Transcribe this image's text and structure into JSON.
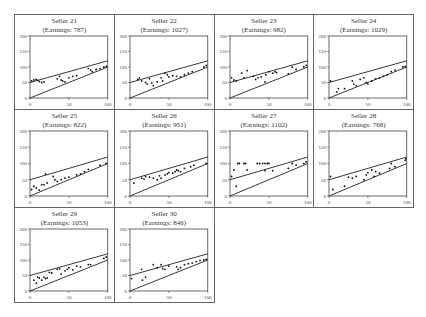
{
  "chart_data": {
    "type": "scatter",
    "title": "",
    "xlim": [
      0,
      100
    ],
    "ylim": [
      0,
      200
    ],
    "xticks": [
      0,
      50,
      100
    ],
    "yticks": [
      0,
      50,
      100,
      150,
      200
    ],
    "reference_lines": [
      {
        "name": "upper",
        "x": [
          0,
          100
        ],
        "y": [
          50,
          120
        ]
      },
      {
        "name": "lower",
        "x": [
          0,
          100
        ],
        "y": [
          0,
          100
        ]
      }
    ],
    "panels": [
      {
        "seller": "Seller 21",
        "earnings_label": "(Earnings: 787)",
        "earnings": 787,
        "points": [
          [
            2,
            55
          ],
          [
            5,
            58
          ],
          [
            8,
            60
          ],
          [
            10,
            57
          ],
          [
            12,
            53
          ],
          [
            15,
            50
          ],
          [
            18,
            52
          ],
          [
            35,
            62
          ],
          [
            38,
            70
          ],
          [
            40,
            58
          ],
          [
            42,
            55
          ],
          [
            45,
            52
          ],
          [
            50,
            65
          ],
          [
            55,
            70
          ],
          [
            60,
            72
          ],
          [
            75,
            95
          ],
          [
            78,
            90
          ],
          [
            80,
            85
          ],
          [
            85,
            92
          ],
          [
            90,
            95
          ],
          [
            95,
            100
          ],
          [
            98,
            102
          ]
        ]
      },
      {
        "seller": "Seller 22",
        "earnings_label": "(Earnings: 1027)",
        "earnings": 1027,
        "points": [
          [
            10,
            60
          ],
          [
            12,
            65
          ],
          [
            15,
            55
          ],
          [
            20,
            50
          ],
          [
            22,
            45
          ],
          [
            25,
            62
          ],
          [
            28,
            48
          ],
          [
            30,
            40
          ],
          [
            35,
            52
          ],
          [
            40,
            65
          ],
          [
            42,
            55
          ],
          [
            45,
            80
          ],
          [
            48,
            75
          ],
          [
            50,
            68
          ],
          [
            55,
            72
          ],
          [
            60,
            70
          ],
          [
            65,
            68
          ],
          [
            70,
            75
          ],
          [
            75,
            80
          ],
          [
            80,
            85
          ],
          [
            95,
            100
          ],
          [
            98,
            105
          ]
        ]
      },
      {
        "seller": "Seller 23",
        "earnings_label": "(Earnings: 982)",
        "earnings": 982,
        "points": [
          [
            2,
            65
          ],
          [
            5,
            58
          ],
          [
            8,
            55
          ],
          [
            15,
            80
          ],
          [
            18,
            65
          ],
          [
            22,
            88
          ],
          [
            30,
            70
          ],
          [
            33,
            60
          ],
          [
            36,
            65
          ],
          [
            40,
            68
          ],
          [
            45,
            52
          ],
          [
            46,
            75
          ],
          [
            50,
            85
          ],
          [
            55,
            80
          ],
          [
            58,
            85
          ],
          [
            60,
            82
          ],
          [
            75,
            78
          ],
          [
            80,
            100
          ],
          [
            85,
            92
          ],
          [
            95,
            100
          ],
          [
            98,
            105
          ]
        ]
      },
      {
        "seller": "Seller 24",
        "earnings_label": "(Earnings: 1029)",
        "earnings": 1029,
        "points": [
          [
            2,
            55
          ],
          [
            10,
            20
          ],
          [
            12,
            30
          ],
          [
            20,
            30
          ],
          [
            30,
            55
          ],
          [
            32,
            45
          ],
          [
            35,
            40
          ],
          [
            40,
            60
          ],
          [
            45,
            65
          ],
          [
            48,
            50
          ],
          [
            50,
            45
          ],
          [
            55,
            55
          ],
          [
            60,
            62
          ],
          [
            65,
            65
          ],
          [
            70,
            70
          ],
          [
            75,
            75
          ],
          [
            80,
            85
          ],
          [
            85,
            90
          ],
          [
            95,
            100
          ],
          [
            98,
            102
          ]
        ]
      },
      {
        "seller": "Seller 25",
        "earnings_label": "(Earnings: 822)",
        "earnings": 822,
        "points": [
          [
            2,
            20
          ],
          [
            5,
            30
          ],
          [
            8,
            25
          ],
          [
            12,
            18
          ],
          [
            15,
            35
          ],
          [
            18,
            35
          ],
          [
            20,
            68
          ],
          [
            22,
            40
          ],
          [
            30,
            60
          ],
          [
            32,
            50
          ],
          [
            35,
            45
          ],
          [
            40,
            50
          ],
          [
            45,
            55
          ],
          [
            50,
            58
          ],
          [
            60,
            65
          ],
          [
            65,
            68
          ],
          [
            70,
            75
          ],
          [
            75,
            82
          ],
          [
            90,
            95
          ],
          [
            98,
            100
          ]
        ]
      },
      {
        "seller": "Seller 26",
        "earnings_label": "(Earnings: 951)",
        "earnings": 951,
        "points": [
          [
            5,
            40
          ],
          [
            15,
            55
          ],
          [
            18,
            52
          ],
          [
            20,
            60
          ],
          [
            25,
            58
          ],
          [
            30,
            55
          ],
          [
            35,
            50
          ],
          [
            38,
            62
          ],
          [
            40,
            55
          ],
          [
            45,
            65
          ],
          [
            48,
            68
          ],
          [
            50,
            72
          ],
          [
            55,
            70
          ],
          [
            58,
            75
          ],
          [
            60,
            80
          ],
          [
            62,
            78
          ],
          [
            65,
            75
          ],
          [
            70,
            85
          ],
          [
            78,
            90
          ],
          [
            82,
            95
          ],
          [
            98,
            100
          ]
        ]
      },
      {
        "seller": "Seller 27",
        "earnings_label": "(Earnings: 1102)",
        "earnings": 1102,
        "points": [
          [
            2,
            60
          ],
          [
            5,
            80
          ],
          [
            8,
            30
          ],
          [
            10,
            100
          ],
          [
            12,
            100
          ],
          [
            18,
            100
          ],
          [
            20,
            100
          ],
          [
            22,
            80
          ],
          [
            35,
            100
          ],
          [
            38,
            100
          ],
          [
            42,
            100
          ],
          [
            45,
            100
          ],
          [
            48,
            100
          ],
          [
            50,
            100
          ],
          [
            45,
            78
          ],
          [
            55,
            78
          ],
          [
            75,
            85
          ],
          [
            80,
            100
          ],
          [
            85,
            95
          ],
          [
            95,
            100
          ],
          [
            98,
            105
          ]
        ]
      },
      {
        "seller": "Seller 28",
        "earnings_label": "(Earnings: 768)",
        "earnings": 768,
        "points": [
          [
            2,
            60
          ],
          [
            5,
            20
          ],
          [
            20,
            30
          ],
          [
            25,
            58
          ],
          [
            30,
            55
          ],
          [
            35,
            60
          ],
          [
            45,
            50
          ],
          [
            48,
            65
          ],
          [
            50,
            72
          ],
          [
            55,
            80
          ],
          [
            58,
            60
          ],
          [
            60,
            75
          ],
          [
            65,
            70
          ],
          [
            78,
            85
          ],
          [
            80,
            100
          ],
          [
            85,
            90
          ],
          [
            98,
            110
          ],
          [
            99,
            115
          ]
        ]
      },
      {
        "seller": "Seller 29",
        "earnings_label": "(Earnings: 1053)",
        "earnings": 1053,
        "points": [
          [
            5,
            35
          ],
          [
            8,
            25
          ],
          [
            10,
            45
          ],
          [
            12,
            42
          ],
          [
            15,
            35
          ],
          [
            18,
            45
          ],
          [
            20,
            40
          ],
          [
            22,
            42
          ],
          [
            25,
            60
          ],
          [
            28,
            58
          ],
          [
            35,
            70
          ],
          [
            38,
            72
          ],
          [
            40,
            55
          ],
          [
            45,
            65
          ],
          [
            48,
            70
          ],
          [
            50,
            75
          ],
          [
            55,
            68
          ],
          [
            60,
            80
          ],
          [
            65,
            78
          ],
          [
            75,
            85
          ],
          [
            78,
            85
          ],
          [
            95,
            105
          ],
          [
            98,
            110
          ]
        ]
      },
      {
        "seller": "Seller 30",
        "earnings_label": "(Earnings: 846)",
        "earnings": 846,
        "points": [
          [
            2,
            40
          ],
          [
            15,
            70
          ],
          [
            16,
            35
          ],
          [
            20,
            45
          ],
          [
            30,
            85
          ],
          [
            35,
            75
          ],
          [
            40,
            85
          ],
          [
            42,
            72
          ],
          [
            45,
            70
          ],
          [
            50,
            80
          ],
          [
            60,
            78
          ],
          [
            62,
            70
          ],
          [
            65,
            75
          ],
          [
            70,
            85
          ],
          [
            75,
            88
          ],
          [
            80,
            90
          ],
          [
            85,
            95
          ],
          [
            90,
            98
          ],
          [
            95,
            100
          ],
          [
            98,
            102
          ]
        ]
      }
    ]
  }
}
